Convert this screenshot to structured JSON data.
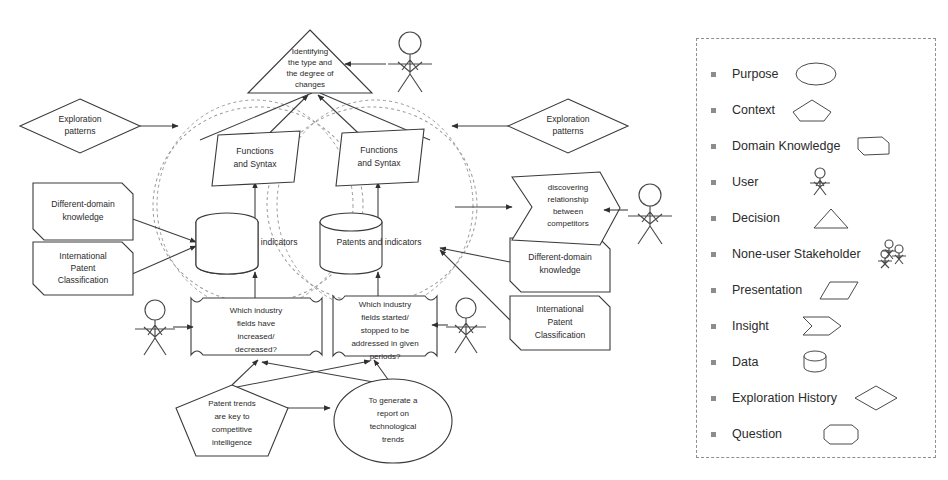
{
  "diagram": {
    "title_present": false,
    "nodes": [
      {
        "id": "decision-top",
        "type": "decision",
        "label": "Identifying the type and the degree of changes",
        "lines": [
          "Identifying",
          "the type and",
          "the degree of",
          "changes"
        ]
      },
      {
        "id": "exploration-patterns-left",
        "type": "exploration-history",
        "label": "Exploration patterns",
        "lines": [
          "Exploration",
          "patterns"
        ]
      },
      {
        "id": "exploration-patterns-right",
        "type": "exploration-history",
        "label": "Exploration patterns",
        "lines": [
          "Exploration",
          "patterns"
        ]
      },
      {
        "id": "domain-knowledge-left-1",
        "type": "domain-knowledge",
        "label": "Different-domain knowledge",
        "lines": [
          "Different-domain",
          "knowledge"
        ]
      },
      {
        "id": "domain-knowledge-left-2",
        "type": "domain-knowledge",
        "label": "International Patent Classification",
        "lines": [
          "International",
          "Patent",
          "Classification"
        ]
      },
      {
        "id": "domain-knowledge-right-1",
        "type": "domain-knowledge",
        "label": "Different-domain knowledge",
        "lines": [
          "Different-domain",
          "knowledge"
        ]
      },
      {
        "id": "domain-knowledge-right-2",
        "type": "domain-knowledge",
        "label": "International Patent Classification",
        "lines": [
          "International",
          "Patent",
          "Classification"
        ]
      },
      {
        "id": "presentation-left",
        "type": "presentation",
        "label": "Functions and Syntax",
        "lines": [
          "Functions",
          "and Syntax"
        ]
      },
      {
        "id": "presentation-right",
        "type": "presentation",
        "label": "Functions and Syntax",
        "lines": [
          "Functions",
          "and Syntax"
        ]
      },
      {
        "id": "data-left",
        "type": "data",
        "label": "Patents and indicators",
        "lines": [
          "Patents and indicators"
        ]
      },
      {
        "id": "data-right",
        "type": "data",
        "label": "Patents and indicators",
        "lines": [
          "Patents and indicators"
        ]
      },
      {
        "id": "insight-right",
        "type": "insight",
        "label": "discovering relationship between competitors",
        "lines": [
          "discovering",
          "relationship",
          "between",
          "competitors"
        ]
      },
      {
        "id": "question-left",
        "type": "question",
        "label": "Which industry fields have increased/ decreased?",
        "lines": [
          "Which industry",
          "fields have",
          "increased/",
          "decreased?"
        ]
      },
      {
        "id": "question-right",
        "type": "question",
        "label": "Which industry fields started/ stopped to be addressed in given periods?",
        "lines": [
          "Which industry",
          "fields started/",
          "stopped to be",
          "addressed in given",
          "periods?"
        ]
      },
      {
        "id": "context-bottom",
        "type": "context",
        "label": "Patent trends are key to competitive intelligence",
        "lines": [
          "Patent trends",
          "are key to",
          "competitive",
          "intelligence"
        ]
      },
      {
        "id": "purpose-bottom",
        "type": "purpose",
        "label": "To generate a report on technological trends",
        "lines": [
          "To generate a",
          "report on",
          "technological",
          "trends"
        ]
      }
    ],
    "actors": [
      {
        "id": "user-top-right",
        "type": "user"
      },
      {
        "id": "user-right-insight",
        "type": "user"
      },
      {
        "id": "user-bottom-left",
        "type": "user"
      },
      {
        "id": "user-bottom-right",
        "type": "user"
      }
    ]
  },
  "legend": {
    "items": [
      {
        "label": "Purpose",
        "icon": "ellipse-icon"
      },
      {
        "label": "Context",
        "icon": "pentagon-icon"
      },
      {
        "label": "Domain Knowledge",
        "icon": "folded-rect-icon"
      },
      {
        "label": "User",
        "icon": "stick-figure-icon"
      },
      {
        "label": "Decision",
        "icon": "triangle-icon"
      },
      {
        "label": "None-user Stakeholder",
        "icon": "stick-figure-group-icon"
      },
      {
        "label": "Presentation",
        "icon": "parallelogram-icon"
      },
      {
        "label": "Insight",
        "icon": "chevron-arrow-icon"
      },
      {
        "label": "Data",
        "icon": "cylinder-icon"
      },
      {
        "label": "Exploration History",
        "icon": "diamond-icon"
      },
      {
        "label": "Question",
        "icon": "rounded-rect-icon"
      }
    ]
  },
  "colors": {
    "stroke": "#3a3a3a",
    "dashed": "#9a9a9a",
    "text": "#2a2a2a",
    "background": "#ffffff"
  }
}
